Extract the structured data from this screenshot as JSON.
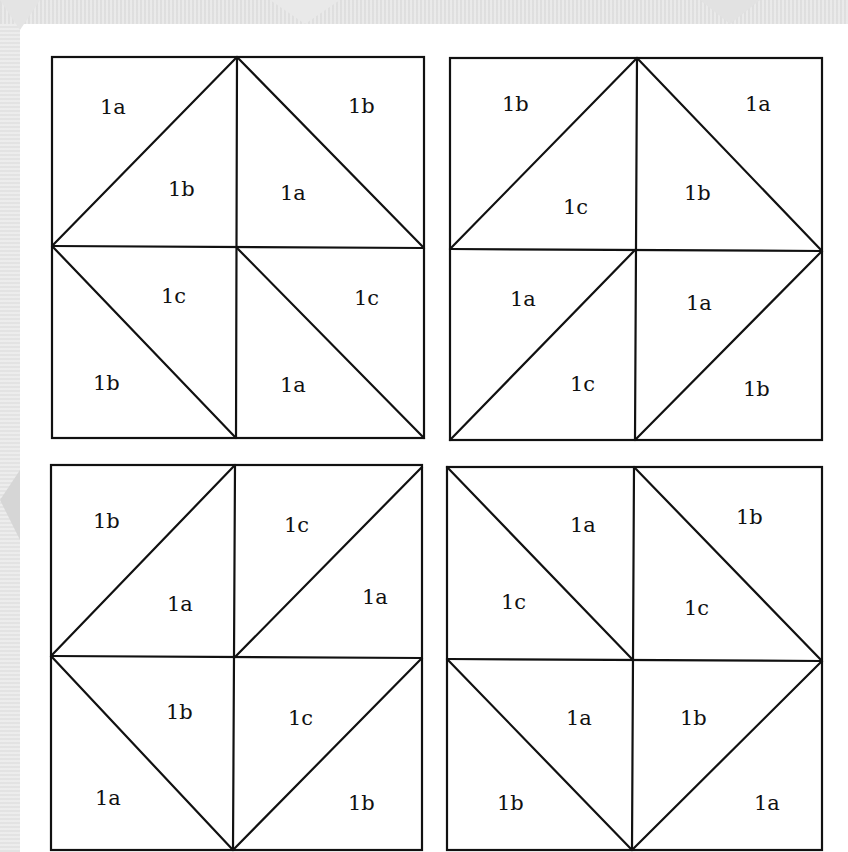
{
  "diagram": {
    "title": "",
    "colors": {
      "line": "#111111",
      "background": "#ffffff",
      "backdrop_pattern": "#d9d9d9"
    },
    "blocks": [
      {
        "id": "top-left",
        "labels": [
          "1a",
          "1b",
          "1b",
          "1a",
          "1c",
          "1b",
          "1c",
          "1a"
        ]
      },
      {
        "id": "top-right",
        "labels": [
          "1b",
          "1c",
          "1a",
          "1b",
          "1a",
          "1c",
          "1a",
          "1b"
        ]
      },
      {
        "id": "bottom-left",
        "labels": [
          "1b",
          "1a",
          "1c",
          "1a",
          "1b",
          "1a",
          "1c",
          "1b"
        ]
      },
      {
        "id": "bottom-right",
        "labels": [
          "1a",
          "1c",
          "1b",
          "1c",
          "1a",
          "1b",
          "1b",
          "1a"
        ]
      }
    ]
  }
}
